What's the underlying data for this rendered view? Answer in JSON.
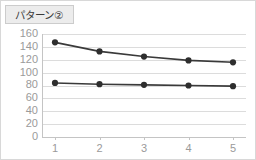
{
  "title": {
    "text": "パターン②"
  },
  "chart_data": {
    "type": "line",
    "title": "パターン②",
    "xlabel": "",
    "ylabel": "",
    "categories": [
      "1",
      "2",
      "3",
      "4",
      "5"
    ],
    "x": [
      1,
      2,
      3,
      4,
      5
    ],
    "series": [
      {
        "name": "series-upper",
        "values": [
          147,
          133,
          125,
          119,
          116
        ],
        "color": "#2e2e2e"
      },
      {
        "name": "series-lower",
        "values": [
          84,
          82,
          81,
          80,
          79
        ],
        "color": "#2e2e2e"
      }
    ],
    "ylim": [
      0,
      160
    ],
    "ytick_values": [
      0,
      20,
      40,
      60,
      80,
      100,
      120,
      140,
      160
    ],
    "ytick_labels": [
      "0",
      "20",
      "40",
      "60",
      "80",
      "100",
      "120",
      "140",
      "160"
    ],
    "xtick_labels": [
      "1",
      "2",
      "3",
      "4",
      "5"
    ],
    "grid": true,
    "legend": false,
    "colors": {
      "line": "#2e2e2e",
      "gridline": "#dcdcdc",
      "tick_label": "#9a9a9a",
      "title_background": "#ececec",
      "title_text": "#3a3a3a",
      "frame_border": "#d8d8d8",
      "plot_background": "#ffffff"
    }
  }
}
